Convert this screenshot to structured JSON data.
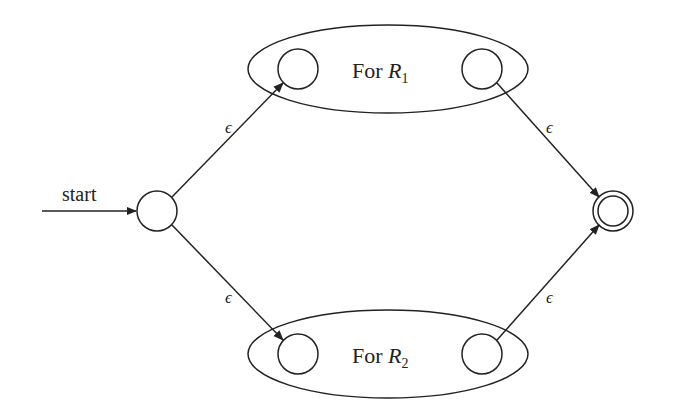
{
  "diagram": {
    "start_label": "start",
    "epsilon": "ϵ",
    "box_top": {
      "prefix": "For ",
      "var": "R",
      "sub": "1"
    },
    "box_bottom": {
      "prefix": "For ",
      "var": "R",
      "sub": "2"
    },
    "states": [
      {
        "id": "start",
        "accepting": false
      },
      {
        "id": "r1-start",
        "accepting": false
      },
      {
        "id": "r1-final",
        "accepting": false
      },
      {
        "id": "r2-start",
        "accepting": false
      },
      {
        "id": "r2-final",
        "accepting": false
      },
      {
        "id": "final",
        "accepting": true
      }
    ],
    "edges": [
      {
        "from": "start",
        "to": "r1-start",
        "label": "ϵ"
      },
      {
        "from": "start",
        "to": "r2-start",
        "label": "ϵ"
      },
      {
        "from": "r1-final",
        "to": "final",
        "label": "ϵ"
      },
      {
        "from": "r2-final",
        "to": "final",
        "label": "ϵ"
      }
    ],
    "colors": {
      "stroke": "#222222",
      "background": "#ffffff"
    }
  }
}
